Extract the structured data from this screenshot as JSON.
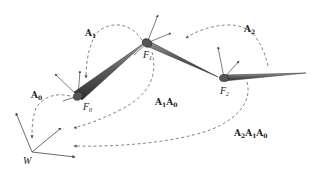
{
  "diagram": {
    "colors": {
      "bone": "#707070",
      "bone_dark": "#3a3a3a",
      "arrow": "#444444",
      "dashed": "#666666",
      "background": "#ffffff"
    },
    "nodes": [
      {
        "id": "F0",
        "label": "F",
        "sub": "0"
      },
      {
        "id": "F1",
        "label": "F",
        "sub": "1"
      },
      {
        "id": "F2",
        "label": "F",
        "sub": "2"
      },
      {
        "id": "W",
        "label": "W"
      }
    ],
    "transforms": [
      {
        "id": "A0",
        "label": "A",
        "sub": "0",
        "from": "F0",
        "to": "W"
      },
      {
        "id": "A1",
        "label": "A",
        "sub": "1",
        "from": "F1",
        "to": "F0"
      },
      {
        "id": "A2",
        "label": "A",
        "sub": "2",
        "from": "F2",
        "to": "F1"
      },
      {
        "id": "A1A0",
        "parts": [
          [
            "A",
            "1"
          ],
          [
            "A",
            "0"
          ]
        ],
        "from": "F1",
        "to": "W"
      },
      {
        "id": "A2A1A0",
        "parts": [
          [
            "A",
            "2"
          ],
          [
            "A",
            "1"
          ],
          [
            "A",
            "0"
          ]
        ],
        "from": "F2",
        "to": "W"
      }
    ]
  }
}
